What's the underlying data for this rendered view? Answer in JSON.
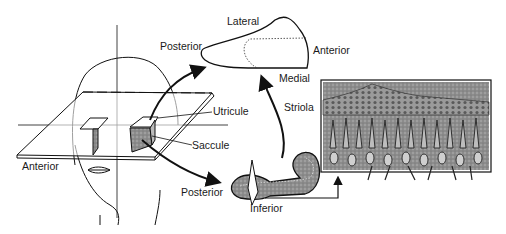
{
  "figure": {
    "labels": {
      "lateral": "Lateral",
      "posterior_top": "Posterior",
      "anterior_top": "Anterior",
      "medial": "Medial",
      "striola": "Striola",
      "utricule": "Utricule",
      "saccule": "Saccule",
      "anterior_left": "Anterior",
      "posterior_bottom": "Posterior",
      "inferior": "Inferior"
    },
    "colors": {
      "line": "#111111",
      "stipple_fill": "#8a8a8a",
      "background": "#ffffff"
    }
  }
}
